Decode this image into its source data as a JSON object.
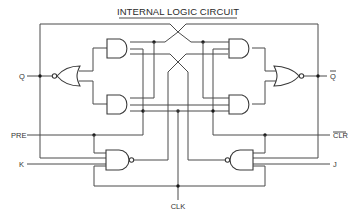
{
  "diagram": {
    "title": "INTERNAL LOGIC CIRCUIT",
    "type": "logic-circuit",
    "colors": {
      "line": "#4a4a4a",
      "background": "#ffffff",
      "text": "#333333"
    },
    "signals": {
      "q": "Q",
      "q_bar": "Q",
      "pre": "PRE",
      "clr": "CLR",
      "k": "K",
      "j": "J",
      "clk": "CLK"
    },
    "overlined_signals": [
      "q_bar",
      "clr"
    ],
    "gates": [
      {
        "id": "nor-left",
        "type": "NOR",
        "output": "Q",
        "inverted_input_bubble": true
      },
      {
        "id": "and-upper-left",
        "type": "AND"
      },
      {
        "id": "and-lower-left",
        "type": "AND"
      },
      {
        "id": "and-upper-right",
        "type": "AND"
      },
      {
        "id": "and-lower-right",
        "type": "AND"
      },
      {
        "id": "nor-right",
        "type": "NOR",
        "output": "Q-bar"
      },
      {
        "id": "nand-left",
        "type": "NAND",
        "inputs": [
          "PRE",
          "Q",
          "K",
          "CLK"
        ]
      },
      {
        "id": "nand-right",
        "type": "NAND",
        "inputs": [
          "CLR",
          "Q-bar",
          "J",
          "CLK"
        ]
      }
    ]
  }
}
